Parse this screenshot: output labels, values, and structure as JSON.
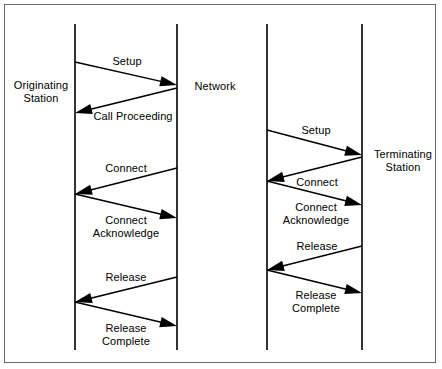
{
  "figure": {
    "type": "call-flow-sequence-diagram",
    "background_color": "#ffffff",
    "line_color": "#000000",
    "border_color": "#6b6b6b"
  },
  "nodes": [
    {
      "id": "originating-station",
      "label_line1": "Originating",
      "label_line2": "Station",
      "lifeline_x": 75,
      "label_x": 8,
      "label_y": 79,
      "label_width": 66
    },
    {
      "id": "network-left",
      "label_line1": "Network",
      "label_line2": "",
      "lifeline_x": 177,
      "label_x": 185,
      "label_y": 80,
      "label_width": 60
    },
    {
      "id": "network-right",
      "label_line1": "",
      "label_line2": "",
      "lifeline_x": 267,
      "label_x": 0,
      "label_y": 0,
      "label_width": 0
    },
    {
      "id": "terminating-station",
      "label_line1": "Terminating",
      "label_line2": "Station",
      "lifeline_x": 362,
      "label_x": 368,
      "label_y": 148,
      "label_width": 70
    }
  ],
  "lifelines": {
    "top_y": 24,
    "bottom_y": 350
  },
  "messages": [
    {
      "id": "msg-setup-left",
      "label_line1": "Setup",
      "label_line2": "",
      "direction": "right",
      "from_x": 75,
      "from_y": 62,
      "to_x": 177,
      "to_y": 85,
      "label_x": 86,
      "label_y": 55,
      "label_width": 82
    },
    {
      "id": "msg-call-proceeding",
      "label_line1": "Call Proceeding",
      "label_line2": "",
      "direction": "left",
      "from_x": 177,
      "from_y": 88,
      "to_x": 75,
      "to_y": 113,
      "label_x": 87,
      "label_y": 110,
      "label_width": 92
    },
    {
      "id": "msg-connect-left",
      "label_line1": "Connect",
      "label_line2": "",
      "direction": "left",
      "from_x": 177,
      "from_y": 168,
      "to_x": 75,
      "to_y": 194,
      "label_x": 85,
      "label_y": 162,
      "label_width": 82
    },
    {
      "id": "msg-connect-acknowledge-left",
      "label_line1": "Connect",
      "label_line2": "Acknowledge",
      "direction": "right",
      "from_x": 75,
      "from_y": 194,
      "to_x": 177,
      "to_y": 218,
      "label_x": 82,
      "label_y": 214,
      "label_width": 88
    },
    {
      "id": "msg-release-left",
      "label_line1": "Release",
      "label_line2": "",
      "direction": "left",
      "from_x": 177,
      "from_y": 277,
      "to_x": 75,
      "to_y": 302,
      "label_x": 85,
      "label_y": 271,
      "label_width": 82
    },
    {
      "id": "msg-release-complete-left",
      "label_line1": "Release",
      "label_line2": "Complete",
      "direction": "right",
      "from_x": 75,
      "from_y": 302,
      "to_x": 177,
      "to_y": 326,
      "label_x": 84,
      "label_y": 322,
      "label_width": 84
    },
    {
      "id": "msg-setup-right",
      "label_line1": "Setup",
      "label_line2": "",
      "direction": "right",
      "from_x": 267,
      "from_y": 130,
      "to_x": 362,
      "to_y": 155,
      "label_x": 276,
      "label_y": 124,
      "label_width": 80
    },
    {
      "id": "msg-connect-right",
      "label_line1": "Connect",
      "label_line2": "",
      "direction": "left",
      "from_x": 362,
      "from_y": 157,
      "to_x": 267,
      "to_y": 181,
      "label_x": 277,
      "label_y": 176,
      "label_width": 80
    },
    {
      "id": "msg-connect-acknowledge-right",
      "label_line1": "Connect",
      "label_line2": "Acknowledge",
      "direction": "right",
      "from_x": 267,
      "from_y": 181,
      "to_x": 362,
      "to_y": 205,
      "label_x": 272,
      "label_y": 201,
      "label_width": 88
    },
    {
      "id": "msg-release-right",
      "label_line1": "Release",
      "label_line2": "",
      "direction": "left",
      "from_x": 362,
      "from_y": 246,
      "to_x": 267,
      "to_y": 270,
      "label_x": 277,
      "label_y": 240,
      "label_width": 80
    },
    {
      "id": "msg-release-complete-right",
      "label_line1": "Release",
      "label_line2": "Complete",
      "direction": "right",
      "from_x": 267,
      "from_y": 270,
      "to_x": 362,
      "to_y": 293,
      "label_x": 274,
      "label_y": 289,
      "label_width": 84
    }
  ]
}
